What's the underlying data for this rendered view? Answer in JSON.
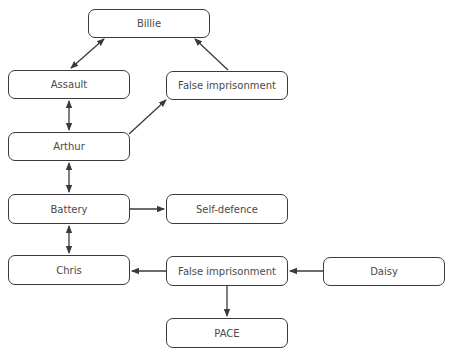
{
  "diagram": {
    "type": "flow",
    "nodes": [
      {
        "id": "billie",
        "label": "Billie",
        "x": 88,
        "y": 9,
        "w": 122,
        "h": 29
      },
      {
        "id": "assault",
        "label": "Assault",
        "x": 8,
        "y": 70,
        "w": 122,
        "h": 29
      },
      {
        "id": "false_imprisonment_1",
        "label": "False imprisonment",
        "x": 166,
        "y": 71,
        "w": 122,
        "h": 29
      },
      {
        "id": "arthur",
        "label": "Arthur",
        "x": 8,
        "y": 132,
        "w": 122,
        "h": 29
      },
      {
        "id": "battery",
        "label": "Battery",
        "x": 8,
        "y": 194,
        "w": 122,
        "h": 30
      },
      {
        "id": "self_defence",
        "label": "Self-defence",
        "x": 166,
        "y": 194,
        "w": 122,
        "h": 30
      },
      {
        "id": "chris",
        "label": "Chris",
        "x": 8,
        "y": 255,
        "w": 122,
        "h": 30
      },
      {
        "id": "false_imprisonment_2",
        "label": "False imprisonment",
        "x": 166,
        "y": 256,
        "w": 122,
        "h": 30
      },
      {
        "id": "daisy",
        "label": "Daisy",
        "x": 323,
        "y": 257,
        "w": 122,
        "h": 29
      },
      {
        "id": "pace",
        "label": "PACE",
        "x": 166,
        "y": 318,
        "w": 122,
        "h": 30
      }
    ],
    "edges": [
      {
        "from": "assault",
        "to": "billie",
        "direction": "both"
      },
      {
        "from": "false_imprisonment_1",
        "to": "billie",
        "direction": "forward"
      },
      {
        "from": "arthur",
        "to": "assault",
        "direction": "both"
      },
      {
        "from": "arthur",
        "to": "false_imprisonment_1",
        "direction": "forward"
      },
      {
        "from": "arthur",
        "to": "battery",
        "direction": "both"
      },
      {
        "from": "battery",
        "to": "self_defence",
        "direction": "forward"
      },
      {
        "from": "battery",
        "to": "chris",
        "direction": "both"
      },
      {
        "from": "false_imprisonment_2",
        "to": "chris",
        "direction": "forward"
      },
      {
        "from": "daisy",
        "to": "false_imprisonment_2",
        "direction": "forward"
      },
      {
        "from": "false_imprisonment_2",
        "to": "pace",
        "direction": "forward"
      }
    ],
    "colors": {
      "stroke": "#3a3a3a",
      "text": "#4a4a4a",
      "background": "#ffffff"
    }
  }
}
